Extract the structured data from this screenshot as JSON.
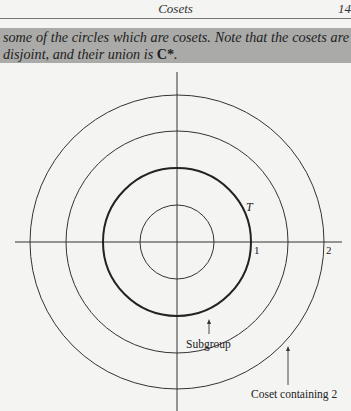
{
  "header": {
    "running_title": "Cosets",
    "page_number": "14"
  },
  "caption": {
    "text": "some of the circles which are cosets. Note that the cosets are disjoint, and their union is ",
    "math": "C*",
    "end": "."
  },
  "diagram": {
    "circles": [
      {
        "name": "inner-circle",
        "radius_units": 0.5
      },
      {
        "name": "unit-circle-T",
        "radius_units": 1,
        "emphasized": true
      },
      {
        "name": "middle-circle",
        "radius_units": 1.5
      },
      {
        "name": "coset-containing-2",
        "radius_units": 2
      }
    ],
    "labels": {
      "circle_label": "T",
      "tick_one": "1",
      "tick_two": "2",
      "subgroup": "Subgroup",
      "coset": "Coset containing 2"
    }
  }
}
